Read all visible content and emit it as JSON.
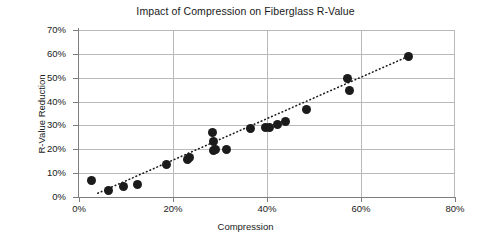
{
  "chart_data": {
    "type": "scatter",
    "title": "Impact of Compression on Fiberglass R-Value",
    "xlabel": "Compression",
    "ylabel": "R-Value Reduction",
    "xlim": [
      0,
      80
    ],
    "ylim": [
      0,
      70
    ],
    "grid": true,
    "legend": false,
    "x_tick_labels": [
      "0%",
      "20%",
      "40%",
      "60%",
      "80%"
    ],
    "x_tick_values": [
      0,
      20,
      40,
      60,
      80
    ],
    "y_tick_labels": [
      "0%",
      "10%",
      "20%",
      "30%",
      "40%",
      "50%",
      "60%",
      "70%"
    ],
    "y_tick_values": [
      0,
      10,
      20,
      30,
      40,
      50,
      60,
      70
    ],
    "series": [
      {
        "name": "Fiberglass samples",
        "marker": "circle",
        "color": "#1b1b1b",
        "points": [
          [
            2.7,
            6.8
          ],
          [
            6.3,
            2.7
          ],
          [
            9.5,
            4.2
          ],
          [
            12.4,
            5.3
          ],
          [
            18.7,
            13.7
          ],
          [
            23.0,
            15.9
          ],
          [
            23.6,
            16.5
          ],
          [
            28.4,
            27.0
          ],
          [
            28.6,
            23.2
          ],
          [
            28.6,
            19.3
          ],
          [
            29.1,
            19.8
          ],
          [
            31.3,
            20.0
          ],
          [
            36.5,
            28.7
          ],
          [
            39.7,
            29.0
          ],
          [
            40.6,
            29.1
          ],
          [
            42.3,
            30.4
          ],
          [
            44.0,
            31.6
          ],
          [
            48.4,
            36.5
          ],
          [
            57.2,
            49.5
          ],
          [
            57.5,
            44.6
          ],
          [
            70.0,
            59.0
          ]
        ]
      }
    ],
    "trendline": {
      "style": "dotted",
      "color": "#1b1b1b",
      "x_start": 4.0,
      "y_start": 1.6,
      "x_end": 70.8,
      "y_end": 59.6
    },
    "annotations": []
  },
  "axis_colors": {
    "grid": "#b9b9b9",
    "axis": "#7d7d7d",
    "text": "#1a1a1a",
    "background": "#ffffff"
  }
}
